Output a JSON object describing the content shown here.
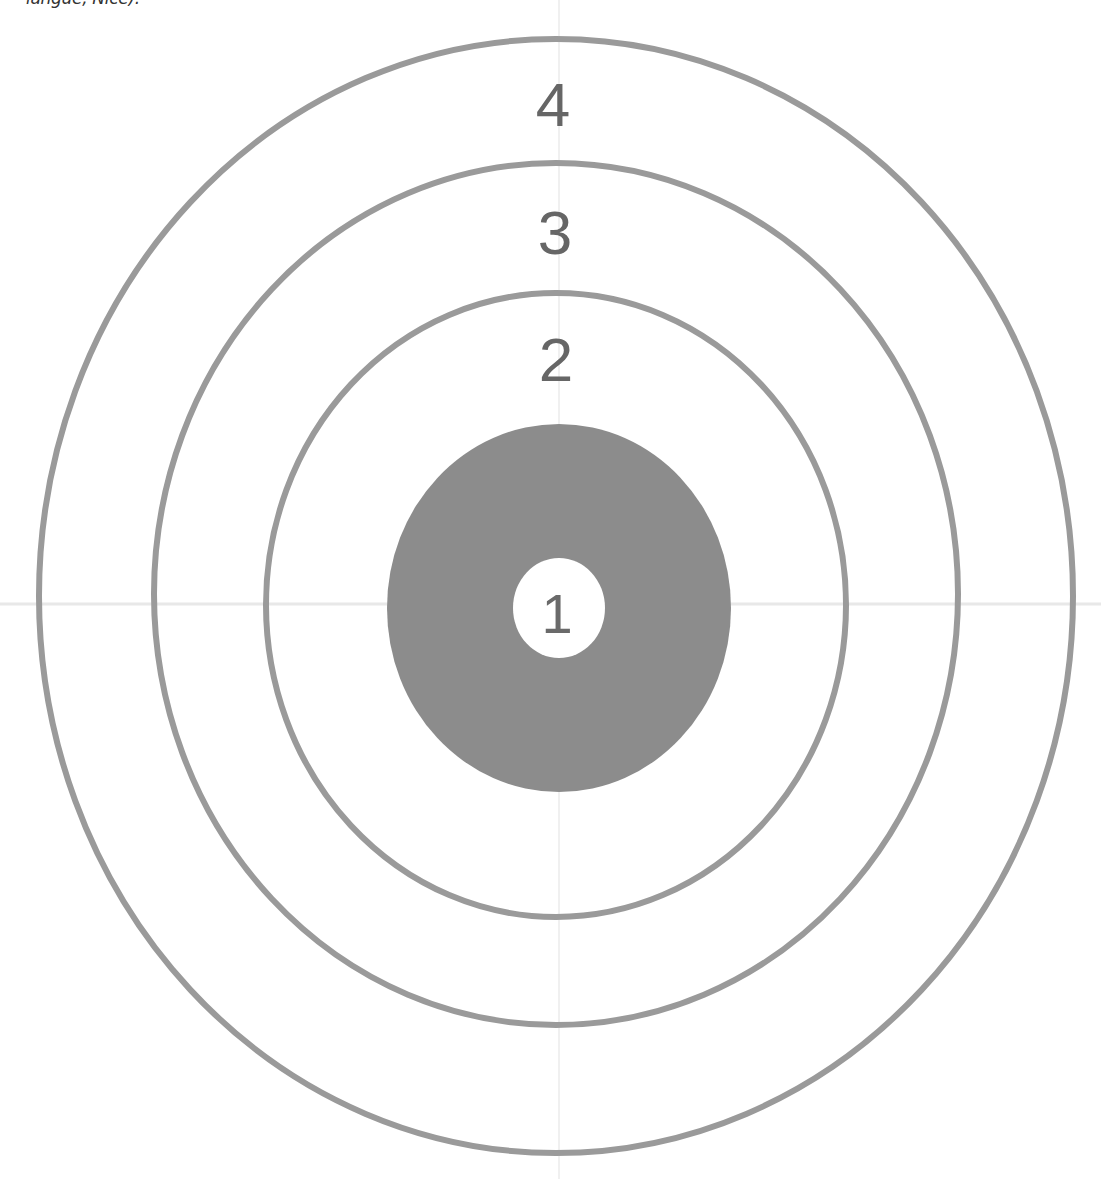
{
  "caption": "langue, Nice).",
  "colors": {
    "ring_stroke": "#9a9a9a",
    "bullseye_fill": "#8c8c8c",
    "center_fill": "#ffffff",
    "label": "#666666",
    "guide_line": "#e6e6e6"
  },
  "target": {
    "rings": [
      {
        "label": "4",
        "name": "outer-ring-4"
      },
      {
        "label": "3",
        "name": "ring-3"
      },
      {
        "label": "2",
        "name": "ring-2"
      }
    ],
    "bullseye": {
      "label": "1"
    }
  }
}
